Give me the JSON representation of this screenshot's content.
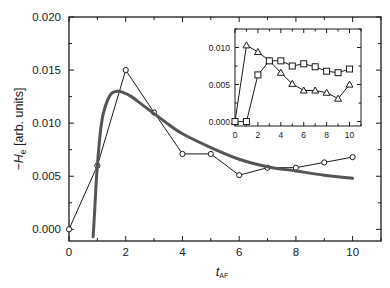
{
  "chart_data": [
    {
      "id": "main",
      "type": "line",
      "title": "",
      "xlabel": "t",
      "xlabel_subscript": "AF",
      "ylabel": "−H",
      "ylabel_subscript": "e",
      "ylabel_suffix": " [arb. units]",
      "xlim": [
        0,
        11
      ],
      "ylim": [
        -0.0011,
        0.02
      ],
      "xticks": [
        0,
        2,
        4,
        6,
        8,
        10
      ],
      "xtick_labels": [
        "0",
        "2",
        "4",
        "6",
        "8",
        "10"
      ],
      "yticks": [
        0.0,
        0.005,
        0.01,
        0.015,
        0.02
      ],
      "ytick_labels": [
        "0.000",
        "0.005",
        "0.010",
        "0.015",
        "0.020"
      ],
      "grid": false,
      "series": [
        {
          "name": "data",
          "style": "line-with-open-circles",
          "x": [
            0,
            1,
            2,
            3,
            4,
            5,
            6,
            7,
            8,
            9,
            10
          ],
          "values": [
            0.0,
            0.006,
            0.015,
            0.011,
            0.0071,
            0.0071,
            0.0051,
            0.0058,
            0.0058,
            0.0063,
            0.0068
          ]
        },
        {
          "name": "fit",
          "style": "thick-smooth-curve",
          "x": [
            0.85,
            0.9,
            0.95,
            1.0,
            1.1,
            1.2,
            1.35,
            1.5,
            1.7,
            1.9,
            2.2,
            2.6,
            3.0,
            3.5,
            4.0,
            5.0,
            6.0,
            7.0,
            8.0,
            9.0,
            10.0
          ],
          "values": [
            -0.0007,
            0.0015,
            0.004,
            0.006,
            0.009,
            0.0108,
            0.0121,
            0.0128,
            0.013,
            0.0129,
            0.0125,
            0.0117,
            0.0109,
            0.0099,
            0.009,
            0.0077,
            0.0066,
            0.0059,
            0.0055,
            0.0051,
            0.0048
          ]
        }
      ]
    },
    {
      "id": "inset",
      "type": "line",
      "title": "",
      "xlabel": "",
      "ylabel": "",
      "xlim": [
        0,
        11
      ],
      "ylim": [
        -0.0006,
        0.0125
      ],
      "xticks": [
        0,
        2,
        4,
        6,
        8,
        10
      ],
      "xtick_labels": [
        "0",
        "2",
        "4",
        "6",
        "8",
        "10"
      ],
      "yticks": [
        0.0,
        0.005,
        0.01
      ],
      "ytick_labels": [
        "0.000",
        "0.005",
        "0.010"
      ],
      "grid": false,
      "series": [
        {
          "name": "triangles",
          "style": "line-with-open-triangles",
          "x": [
            0,
            1,
            2,
            3,
            4,
            5,
            6,
            7,
            8,
            9,
            10
          ],
          "values": [
            0.0,
            0.0103,
            0.0094,
            0.0082,
            0.0066,
            0.0051,
            0.0042,
            0.0042,
            0.0039,
            0.0031,
            0.005
          ]
        },
        {
          "name": "squares",
          "style": "line-with-open-squares",
          "x": [
            0,
            1,
            2,
            3,
            4,
            5,
            6,
            7,
            8,
            9,
            10
          ],
          "values": [
            0.0,
            0.0,
            0.0063,
            0.0082,
            0.0082,
            0.0075,
            0.0078,
            0.0074,
            0.0068,
            0.0066,
            0.0071
          ]
        }
      ]
    }
  ],
  "colors": {
    "axis": "#1a1a1a",
    "data_line": "#1a1a1a",
    "fit_curve": "#555555",
    "background": "#ffffff"
  }
}
